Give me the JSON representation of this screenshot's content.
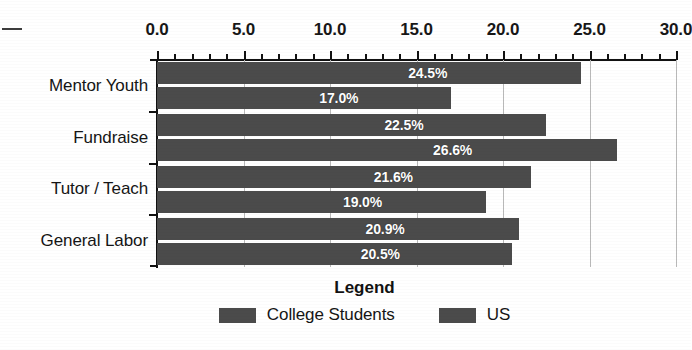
{
  "chart_data": {
    "type": "bar",
    "orientation": "horizontal",
    "title": "",
    "xlabel": "",
    "ylabel": "",
    "xlim": [
      0.0,
      30.0
    ],
    "grid": true,
    "legend_position": "bottom",
    "legend_title": "Legend",
    "major_tick_step": 5.0,
    "minor_tick_step": 1.0,
    "tick_labels": [
      "0.0",
      "5.0",
      "10.0",
      "15.0",
      "20.0",
      "25.0",
      "30.0"
    ],
    "tick_values": [
      0.0,
      5.0,
      10.0,
      15.0,
      20.0,
      25.0,
      30.0
    ],
    "categories": [
      "Mentor Youth",
      "Fundraise",
      "Tutor / Teach",
      "General Labor"
    ],
    "series": [
      {
        "name": "College Students",
        "values": [
          24.5,
          22.5,
          21.6,
          20.9
        ],
        "labels": [
          "24.5%",
          "22.5%",
          "21.6%",
          "20.9%"
        ],
        "color": "#4b4b4b"
      },
      {
        "name": "US",
        "values": [
          17.0,
          26.6,
          19.0,
          20.5
        ],
        "labels": [
          "17.0%",
          "26.6%",
          "19.0%",
          "20.5%"
        ],
        "color": "#4b4b4b"
      }
    ]
  },
  "legend": {
    "title": "Legend",
    "entries": [
      {
        "label": "College Students",
        "color": "#4b4b4b"
      },
      {
        "label": "US",
        "color": "#4b4b4b"
      }
    ]
  },
  "colors": {
    "bar": "#4b4b4b",
    "axis": "#111111",
    "grid": "#b9b9b9",
    "bar_label_text": "#ffffff",
    "background": "#ffffff"
  }
}
